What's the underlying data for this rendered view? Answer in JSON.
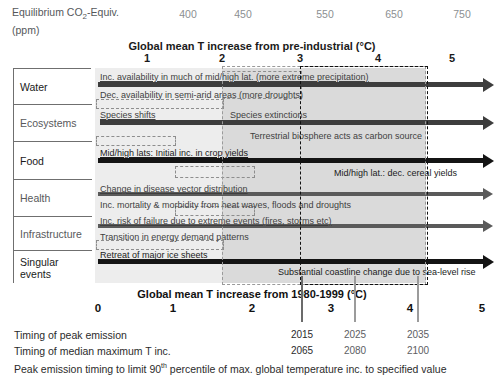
{
  "header": {
    "co2_label_line1": "Equilibrium CO",
    "co2_label_sub": "2",
    "co2_label_line1b": "-Equiv.",
    "co2_label_line2": "(ppm)",
    "co2_ticks": [
      {
        "value": "400",
        "x": 188
      },
      {
        "value": "450",
        "x": 243
      },
      {
        "value": "550",
        "x": 325
      },
      {
        "value": "650",
        "x": 394
      },
      {
        "value": "750",
        "x": 462
      }
    ]
  },
  "top_axis": {
    "title": "Global mean T increase from pre-industrial (°C)",
    "ticks": [
      {
        "label": "1",
        "x": 147
      },
      {
        "label": "2",
        "x": 222
      },
      {
        "label": "3",
        "x": 300
      },
      {
        "label": "4",
        "x": 378
      },
      {
        "label": "5",
        "x": 452
      }
    ]
  },
  "bottom_axis": {
    "title": "Global mean T increase from 1980-1999 (°C)",
    "ticks": [
      {
        "label": "0",
        "x": 98
      },
      {
        "label": "1",
        "x": 173
      },
      {
        "label": "2",
        "x": 252
      },
      {
        "label": "3",
        "x": 331
      },
      {
        "label": "4",
        "x": 410
      },
      {
        "label": "5",
        "x": 482
      }
    ]
  },
  "categories": [
    {
      "name": "Water",
      "top": 0,
      "height": 36,
      "dark": true
    },
    {
      "name": "Ecosystems",
      "top": 36,
      "height": 37,
      "dark": false
    },
    {
      "name": "Food",
      "top": 73,
      "height": 38,
      "dark": true
    },
    {
      "name": "Health",
      "top": 111,
      "height": 37,
      "dark": false
    },
    {
      "name": "Infrastructure",
      "top": 148,
      "height": 34,
      "dark": false
    },
    {
      "name": "Singular events",
      "top": 182,
      "height": 33,
      "dark": true
    }
  ],
  "impacts": [
    {
      "text": "Inc.  availability in much of mid/high lat. (more extreme precipitation)",
      "x": 100,
      "y": 72,
      "underline": true,
      "dark": false
    },
    {
      "text": "Dec. availability in semi-arid areas (more droughts)",
      "x": 100,
      "y": 90,
      "underline": false,
      "dark": false
    },
    {
      "text": "Species shifts",
      "x": 100,
      "y": 110,
      "underline": true,
      "dark": false
    },
    {
      "text": "Species extinctions",
      "x": 230,
      "y": 110,
      "underline": false,
      "dark": false
    },
    {
      "text": "Terrestrial biosphere acts as carbon source",
      "x": 250,
      "y": 131,
      "underline": false,
      "dark": false
    },
    {
      "text": "Mid/high lats: Initial inc. in crop yields",
      "x": 100,
      "y": 148,
      "underline": true,
      "dark": true
    },
    {
      "text": "Mid/high lat.: dec. cereal yields",
      "x": 334,
      "y": 168,
      "underline": false,
      "dark": true
    },
    {
      "text": "Change in disease vector distribution",
      "x": 100,
      "y": 184,
      "underline": true,
      "dark": false
    },
    {
      "text": "Inc. mortality & morbidity from heat waves, floods and droughts",
      "x": 100,
      "y": 200,
      "underline": false,
      "dark": false
    },
    {
      "text": "Inc. risk of failure due to extreme events (fires, storms etc)",
      "x": 100,
      "y": 216,
      "underline": true,
      "dark": false
    },
    {
      "text": "Transition in energy demand patterns",
      "x": 100,
      "y": 232,
      "underline": false,
      "dark": false
    },
    {
      "text": "Retreat of major ice sheets",
      "x": 100,
      "y": 250,
      "underline": true,
      "dark": true
    },
    {
      "text": "Substantial coastline change due to sea-level rise",
      "x": 278,
      "y": 267,
      "underline": false,
      "dark": true
    }
  ],
  "arrows": [
    {
      "name": "water-arrow",
      "x": 98,
      "y": 82,
      "w": 385,
      "style": "thick"
    },
    {
      "name": "ecosystems-arrow",
      "x": 100,
      "y": 120,
      "w": 383,
      "style": "thick"
    },
    {
      "name": "food-arrow",
      "x": 98,
      "y": 158,
      "w": 385,
      "style": "black"
    },
    {
      "name": "health-arrow",
      "x": 98,
      "y": 192,
      "w": 385,
      "style": "thin"
    },
    {
      "name": "infrastructure-arrow",
      "x": 98,
      "y": 224,
      "w": 385,
      "style": "thin"
    },
    {
      "name": "singular-arrow",
      "x": 98,
      "y": 259,
      "w": 385,
      "style": "black"
    }
  ],
  "inner_dashed_boxes": [
    {
      "name": "water-inner-box",
      "x": 222,
      "y": 71,
      "w": 80,
      "h": 28
    },
    {
      "name": "ecosystems-inner-box",
      "x": 96,
      "y": 99,
      "w": 128,
      "h": 10
    },
    {
      "name": "food-inner-box",
      "x": 96,
      "y": 136,
      "w": 80,
      "h": 10
    },
    {
      "name": "health-inner-box",
      "x": 175,
      "y": 166,
      "w": 80,
      "h": 12
    },
    {
      "name": "infra-inner-box",
      "x": 175,
      "y": 206,
      "w": 80,
      "h": 10
    },
    {
      "name": "singular-inner-box",
      "x": 96,
      "y": 240,
      "w": 128,
      "h": 10
    }
  ],
  "shading": {
    "grey_band_color": "#d4d4d4",
    "dashed_grey_color": "#9a9a9a",
    "dashed_black_color": "#111111"
  },
  "year_markers": [
    {
      "x": 301,
      "peak": "2015",
      "median": "2065",
      "dark": true
    },
    {
      "x": 354,
      "peak": "2025",
      "median": "2080",
      "dark": false
    },
    {
      "x": 417,
      "peak": "2035",
      "median": "2100",
      "dark": false
    }
  ],
  "footer": {
    "row1_label": "Timing of peak emission",
    "row2_label": "Timing of median maximum T inc.",
    "row3_label_a": "Peak emission timing to limit 90",
    "row3_sup": "th",
    "row3_label_b": " percentile of max. global temperature inc. to specified value"
  },
  "chart_data": {
    "type": "table",
    "xlabel_top": "Global mean T increase from pre-industrial (°C)",
    "xlabel_bottom": "Global mean T increase from 1980-1999 (°C)",
    "xlim_bottom": [
      0,
      5
    ],
    "xlim_top": [
      1,
      5
    ],
    "co2_equiv_ppm": [
      400,
      450,
      550,
      650,
      750
    ],
    "highlight_band_C": [
      2,
      4.8
    ],
    "highlight_band_black_C": [
      3,
      4.2
    ],
    "peak_emission_years": [
      2015,
      2025,
      2035
    ],
    "median_max_T_years": [
      2065,
      2080,
      2100
    ],
    "peak_emission_temps_C": [
      2.6,
      3.3,
      4.1
    ],
    "sectors": [
      "Water",
      "Ecosystems",
      "Food",
      "Health",
      "Infrastructure",
      "Singular events"
    ]
  }
}
